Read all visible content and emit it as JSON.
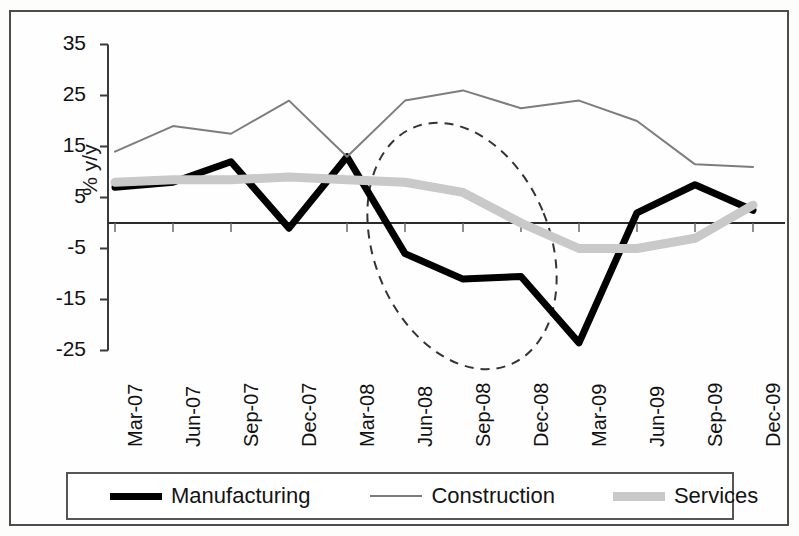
{
  "chart_data": {
    "type": "line",
    "title": "",
    "subtitle": "",
    "xlabel": "",
    "ylabel": "% y/y",
    "categories": [
      "Mar-07",
      "Jun-07",
      "Sep-07",
      "Dec-07",
      "Mar-08",
      "Jun-08",
      "Sep-08",
      "Dec-08",
      "Mar-09",
      "Jun-09",
      "Sep-09",
      "Dec-09"
    ],
    "yticks": [
      35,
      25,
      15,
      5,
      -5,
      -15,
      -25
    ],
    "ylim": [
      -30,
      35
    ],
    "grid": false,
    "legend_position": "bottom",
    "zero_line": 0,
    "series": [
      {
        "name": "Manufacturing",
        "color": "#000000",
        "width": 7,
        "values": [
          7,
          8,
          12,
          -1,
          13,
          -6,
          -11,
          -10.5,
          -23.5,
          2,
          7.5,
          2.5
        ]
      },
      {
        "name": "Construction",
        "color": "#7d7d7d",
        "width": 2,
        "values": [
          14,
          19,
          17.5,
          24,
          13,
          24,
          26,
          22.5,
          24,
          20,
          11.5,
          11
        ]
      },
      {
        "name": "Services",
        "color": "#c9c9c9",
        "width": 9,
        "values": [
          8,
          8.5,
          8.5,
          9,
          8.5,
          8,
          6,
          0,
          -5,
          -5,
          -3,
          3.5
        ]
      }
    ],
    "annotations": [
      {
        "type": "ellipse",
        "style": "dashed",
        "color": "#333333",
        "cx": 462,
        "cy": 246,
        "rx": 88,
        "ry": 128,
        "rotation": -22,
        "label": "recession-highlight-ellipse"
      }
    ]
  },
  "axes": {
    "y_axis_label": "% y/y",
    "y_tick_labels": [
      "35",
      "25",
      "15",
      "5",
      "-5",
      "-15",
      "-25"
    ],
    "x_tick_labels": [
      "Mar-07",
      "Jun-07",
      "Sep-07",
      "Dec-07",
      "Mar-08",
      "Jun-08",
      "Sep-08",
      "Dec-08",
      "Mar-09",
      "Jun-09",
      "Sep-09",
      "Dec-09"
    ]
  },
  "legend": {
    "items": [
      {
        "label": "Manufacturing",
        "swatch": "manufacturing"
      },
      {
        "label": "Construction",
        "swatch": "construction"
      },
      {
        "label": "Services",
        "swatch": "services"
      }
    ]
  }
}
